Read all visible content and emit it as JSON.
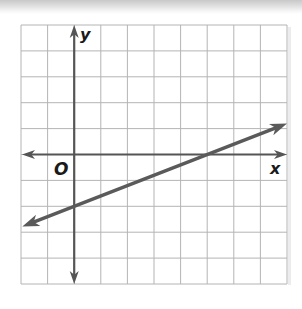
{
  "chart_data": {
    "type": "line",
    "title": "",
    "xlabel": "x",
    "ylabel": "y",
    "origin_label": "O",
    "grid": true,
    "xlim": [
      -2,
      8
    ],
    "ylim": [
      -5,
      5
    ],
    "grid_step": 1,
    "tick_labels": false,
    "series": [
      {
        "name": "line",
        "equation": "y = (2/5)x - 2",
        "slope": 0.4,
        "y_intercept": -2,
        "x_intercept": 5,
        "x": [
          -1.95,
          0,
          5,
          8
        ],
        "y": [
          -2.78,
          -2,
          0,
          1.2
        ],
        "arrows": "both",
        "color": "#555555"
      }
    ]
  },
  "axes": {
    "x_label": "x",
    "y_label": "y",
    "origin_label": "O",
    "axis_color": "#555555",
    "grid_color": "#b4b4b4",
    "line_color": "#5a5a5a"
  }
}
